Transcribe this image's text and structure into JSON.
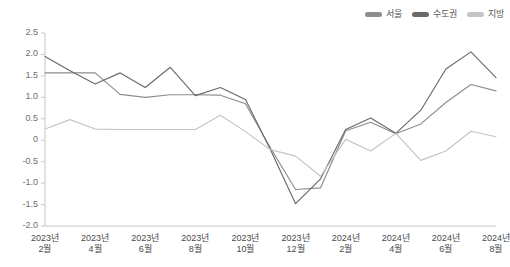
{
  "chart_data": {
    "type": "line",
    "title": "",
    "subtitle": "",
    "xlabel": "",
    "ylabel": "",
    "ylim": [
      -2.0,
      2.5
    ],
    "grid": false,
    "legend_position": "top-right",
    "ytick_labels": [
      "2.5",
      "2.0",
      "1.5",
      "1.0",
      "0.5",
      "0",
      "-0.5",
      "-1.0",
      "-1.5",
      "-2.0"
    ],
    "ytick_values": [
      2.5,
      2.0,
      1.5,
      1.0,
      0.5,
      0,
      -0.5,
      -1.0,
      -1.5,
      -2.0
    ],
    "categories": [
      "2023년 2월",
      "2023년 3월",
      "2023년 4월",
      "2023년 5월",
      "2023년 6월",
      "2023년 7월",
      "2023년 8월",
      "2023년 9월",
      "2023년 10월",
      "2023년 11월",
      "2023년 12월",
      "2024년 1월",
      "2024년 2월",
      "2024년 3월",
      "2024년 4월",
      "2024년 5월",
      "2024년 6월",
      "2024년 7월",
      "2024년 8월"
    ],
    "xtick_labels": [
      {
        "year": "2023년",
        "month": "2월"
      },
      {
        "year": "2023년",
        "month": "4월"
      },
      {
        "year": "2023년",
        "month": "6월"
      },
      {
        "year": "2023년",
        "month": "8월"
      },
      {
        "year": "2023년",
        "month": "10월"
      },
      {
        "year": "2023년",
        "month": "12월"
      },
      {
        "year": "2024년",
        "month": "2월"
      },
      {
        "year": "2024년",
        "month": "4월"
      },
      {
        "year": "2024년",
        "month": "6월"
      },
      {
        "year": "2024년",
        "month": "8월"
      }
    ],
    "series": [
      {
        "name": "서울",
        "color": "#8d8d8d",
        "values": [
          1.57,
          1.57,
          1.57,
          1.07,
          1.0,
          1.06,
          1.06,
          1.05,
          0.85,
          -0.18,
          -1.15,
          -1.11,
          0.22,
          0.42,
          0.15,
          0.38,
          0.88,
          1.3,
          1.15
        ]
      },
      {
        "name": "수도권",
        "color": "#6a6a6a",
        "values": [
          1.95,
          1.62,
          1.31,
          1.57,
          1.23,
          1.7,
          1.04,
          1.23,
          0.95,
          -0.22,
          -1.48,
          -0.9,
          0.25,
          0.52,
          0.16,
          0.7,
          1.66,
          2.06,
          1.46
        ]
      },
      {
        "name": "지방",
        "color": "#c4c4c4",
        "values": [
          0.26,
          0.48,
          0.26,
          0.25,
          0.25,
          0.25,
          0.25,
          0.58,
          0.2,
          -0.22,
          -0.37,
          -0.84,
          0.02,
          -0.25,
          0.16,
          -0.47,
          -0.25,
          0.21,
          0.08
        ]
      }
    ]
  },
  "legend": {
    "items": [
      {
        "label": "서울",
        "color": "#8d8d8d"
      },
      {
        "label": "수도권",
        "color": "#6a6a6a"
      },
      {
        "label": "지방",
        "color": "#c4c4c4"
      }
    ]
  }
}
